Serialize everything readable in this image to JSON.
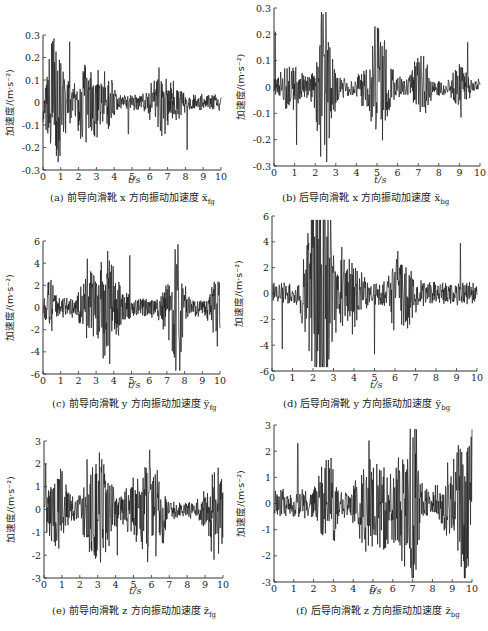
{
  "figure": {
    "y_axis_label": "加速度/(m·s⁻²)",
    "x_axis_label": "t/s"
  },
  "chart_data": [
    {
      "id": "a",
      "type": "line",
      "caption_prefix": "(a)",
      "caption_text": "前导向滑靴 x 方向振动加速度 ẍ",
      "caption_sub": "fg",
      "xlabel": "t/s",
      "ylabel": "加速度/(m·s⁻²)",
      "xlim": [
        0,
        10
      ],
      "ylim": [
        -0.3,
        0.3
      ],
      "xticks": [
        0,
        1,
        2,
        3,
        4,
        5,
        6,
        7,
        8,
        9,
        10
      ],
      "yticks": [
        -0.3,
        -0.2,
        -0.1,
        0,
        0.1,
        0.2,
        0.3
      ],
      "ytick_labels": [
        "-0.3",
        "-0.2",
        "-0.1",
        "0",
        "0.1",
        "0.2",
        "0.3"
      ],
      "peaks": [
        {
          "t": 1.5,
          "v": 0.27
        },
        {
          "t": 4.8,
          "v": 0.24
        },
        {
          "t": 8.1,
          "v": -0.21
        },
        {
          "t": 4.8,
          "v": -0.14
        }
      ],
      "amplitude": 0.09,
      "seed": 11,
      "box": {
        "x": 43,
        "y": 35,
        "w": 178,
        "h": 135
      }
    },
    {
      "id": "b",
      "type": "line",
      "caption_prefix": "(b)",
      "caption_text": "后导向滑靴 x 方向振动加速度 ẍ",
      "caption_sub": "bg",
      "xlabel": "t/s",
      "ylabel": "加速度/(m·s⁻²)",
      "xlim": [
        0,
        10
      ],
      "ylim": [
        -0.3,
        0.3
      ],
      "xticks": [
        0,
        1,
        2,
        3,
        4,
        5,
        6,
        7,
        8,
        9,
        10
      ],
      "yticks": [
        -0.3,
        -0.2,
        -0.1,
        0,
        0.1,
        0.2,
        0.3
      ],
      "ytick_labels": [
        "-0.3",
        "-0.2",
        "-0.1",
        "0",
        "0.1",
        "0.2",
        "0.3"
      ],
      "peaks": [
        {
          "t": 4.9,
          "v": 0.23
        },
        {
          "t": 1.1,
          "v": -0.22
        },
        {
          "t": 0.05,
          "v": 0.21
        },
        {
          "t": 9.4,
          "v": 0.17
        }
      ],
      "amplitude": 0.08,
      "seed": 23,
      "box": {
        "x": 274,
        "y": 8,
        "w": 206,
        "h": 158
      }
    },
    {
      "id": "c",
      "type": "line",
      "caption_prefix": "(c)",
      "caption_text": "前导向滑靴 y 方向振动加速度 ÿ",
      "caption_sub": "fg",
      "xlabel": "t/s",
      "ylabel": "加速度/(m·s⁻²)",
      "xlim": [
        0,
        10
      ],
      "ylim": [
        -6,
        6
      ],
      "xticks": [
        0,
        1,
        2,
        3,
        4,
        5,
        6,
        7,
        8,
        9,
        10
      ],
      "yticks": [
        -6,
        -4,
        -2,
        0,
        2,
        4,
        6
      ],
      "ytick_labels": [
        "-6",
        "-4",
        "-2",
        "0",
        "2",
        "4",
        "6"
      ],
      "peaks": [
        {
          "t": 4.9,
          "v": 4.7
        },
        {
          "t": 2.5,
          "v": 4.4
        },
        {
          "t": 7.8,
          "v": -4.0
        },
        {
          "t": 3.6,
          "v": -3.5
        }
      ],
      "amplitude": 2.2,
      "seed": 37,
      "box": {
        "x": 43,
        "y": 241,
        "w": 177,
        "h": 133
      }
    },
    {
      "id": "d",
      "type": "line",
      "caption_prefix": "(d)",
      "caption_text": "后导向滑靴 y 方向振动加速度 ÿ",
      "caption_sub": "bg",
      "xlabel": "t/s",
      "ylabel": "加速度/(m·s⁻²)",
      "xlim": [
        0,
        10
      ],
      "ylim": [
        -6,
        6
      ],
      "xticks": [
        0,
        1,
        2,
        3,
        4,
        5,
        6,
        7,
        8,
        9,
        10
      ],
      "yticks": [
        -6,
        -4,
        -2,
        0,
        2,
        4,
        6
      ],
      "ytick_labels": [
        "-6",
        "-4",
        "-2",
        "0",
        "2",
        "4",
        "6"
      ],
      "peaks": [
        {
          "t": 9.2,
          "v": 3.9
        },
        {
          "t": 5.0,
          "v": -4.7
        },
        {
          "t": 0.5,
          "v": -4.3
        },
        {
          "t": 3.4,
          "v": 3.6
        }
      ],
      "amplitude": 2.3,
      "seed": 53,
      "box": {
        "x": 272,
        "y": 216,
        "w": 205,
        "h": 155
      }
    },
    {
      "id": "e",
      "type": "line",
      "caption_prefix": "(e)",
      "caption_text": "前导向滑靴 z 方向振动加速度 z̈",
      "caption_sub": "fg",
      "xlabel": "t/s",
      "ylabel": "加速度/(m·s⁻²)",
      "xlim": [
        0,
        10
      ],
      "ylim": [
        -3,
        3
      ],
      "xticks": [
        0,
        1,
        2,
        3,
        4,
        5,
        6,
        7,
        8,
        9,
        10
      ],
      "yticks": [
        -3,
        -2,
        -1,
        0,
        1,
        2,
        3
      ],
      "ytick_labels": [
        "-3",
        "-2",
        "-1",
        "0",
        "1",
        "2",
        "3"
      ],
      "peaks": [
        {
          "t": 2.4,
          "v": 2.2
        },
        {
          "t": 0.1,
          "v": 2.0
        },
        {
          "t": 9.5,
          "v": -2.2
        },
        {
          "t": 4.1,
          "v": -2.0
        }
      ],
      "amplitude": 1.0,
      "seed": 71,
      "box": {
        "x": 44,
        "y": 441,
        "w": 179,
        "h": 137
      }
    },
    {
      "id": "f",
      "type": "line",
      "caption_prefix": "(f)",
      "caption_text": "后导向滑靴 z 方向振动加速度 z̈",
      "caption_sub": "bg",
      "xlabel": "t/s",
      "ylabel": "加速度/(m·s⁻²)",
      "xlim": [
        0,
        10
      ],
      "ylim": [
        -3,
        3
      ],
      "xticks": [
        0,
        1,
        2,
        3,
        4,
        5,
        6,
        7,
        8,
        9,
        10
      ],
      "yticks": [
        -3,
        -2,
        -1,
        0,
        1,
        2,
        3
      ],
      "ytick_labels": [
        "-3",
        "-2",
        "-1",
        "0",
        "1",
        "2",
        "3"
      ],
      "peaks": [
        {
          "t": 4.8,
          "v": 2.4
        },
        {
          "t": 1.2,
          "v": 2.3
        },
        {
          "t": 6.6,
          "v": -2.4
        },
        {
          "t": 9.8,
          "v": -2.4
        }
      ],
      "amplitude": 1.4,
      "seed": 89,
      "box": {
        "x": 274,
        "y": 425,
        "w": 198,
        "h": 157
      }
    }
  ],
  "layout": {
    "captions": [
      {
        "x": 50,
        "y": 197
      },
      {
        "x": 282,
        "y": 197
      },
      {
        "x": 52,
        "y": 403
      },
      {
        "x": 283,
        "y": 403
      },
      {
        "x": 52,
        "y": 610
      },
      {
        "x": 296,
        "y": 610
      }
    ],
    "xlabels": [
      {
        "x": 128,
        "y": 182
      },
      {
        "x": 374,
        "y": 182
      },
      {
        "x": 128,
        "y": 387
      },
      {
        "x": 370,
        "y": 387
      },
      {
        "x": 129,
        "y": 593
      },
      {
        "x": 369,
        "y": 593
      }
    ]
  }
}
